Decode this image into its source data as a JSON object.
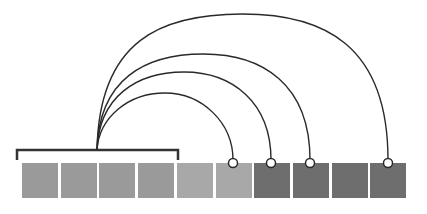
{
  "diagram": {
    "type": "arc-connection-diagram",
    "origin": {
      "x": 97,
      "y": 150
    },
    "bracket": {
      "x1": 17,
      "x2": 178,
      "y": 150,
      "drop": 10,
      "color": "#333333"
    },
    "boxes": [
      {
        "index": 1,
        "x": 22,
        "group": "bracketed",
        "color": "#9a9a9a"
      },
      {
        "index": 2,
        "x": 61,
        "group": "bracketed",
        "color": "#9a9a9a"
      },
      {
        "index": 3,
        "x": 99,
        "group": "bracketed",
        "color": "#9a9a9a"
      },
      {
        "index": 4,
        "x": 138,
        "group": "bracketed",
        "color": "#9a9a9a"
      },
      {
        "index": 5,
        "x": 177,
        "group": "light",
        "color": "#a8a8a8"
      },
      {
        "index": 6,
        "x": 216,
        "group": "light",
        "color": "#a8a8a8"
      },
      {
        "index": 7,
        "x": 254,
        "group": "dark",
        "color": "#6e6e6e"
      },
      {
        "index": 8,
        "x": 293,
        "group": "dark",
        "color": "#6e6e6e"
      },
      {
        "index": 9,
        "x": 332,
        "group": "dark",
        "color": "#6e6e6e"
      },
      {
        "index": 10,
        "x": 370,
        "group": "dark",
        "color": "#6e6e6e"
      }
    ],
    "arcs": [
      {
        "target_box": 6,
        "end_x": 233,
        "top_y": 93
      },
      {
        "target_box": 7,
        "end_x": 271,
        "top_y": 72
      },
      {
        "target_box": 8,
        "end_x": 310,
        "top_y": 54
      },
      {
        "target_box": 10,
        "end_x": 388,
        "top_y": 14
      }
    ],
    "line_color": "#2a2a2a"
  }
}
